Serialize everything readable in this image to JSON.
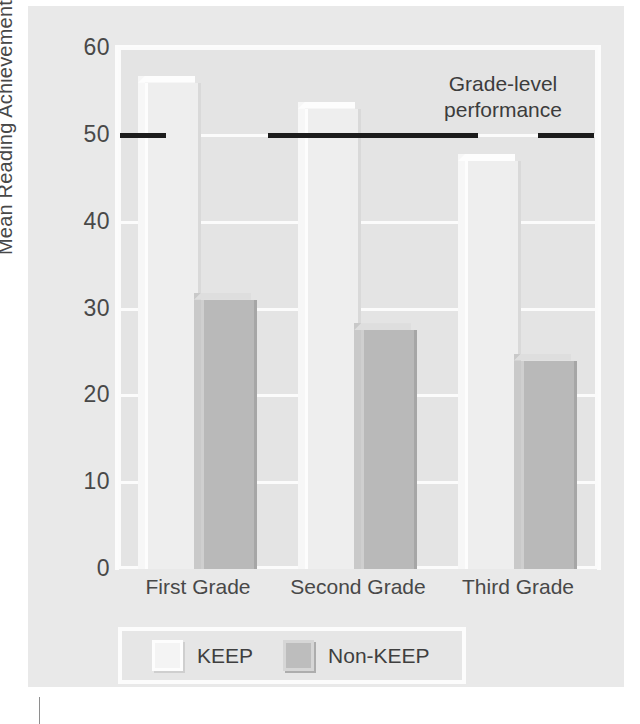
{
  "chart_data": {
    "type": "bar",
    "title": "",
    "xlabel": "",
    "ylabel": "Mean Reading Achievement",
    "ylim": [
      0,
      60
    ],
    "yticks": [
      0,
      10,
      20,
      30,
      40,
      50,
      60
    ],
    "ytick_labels": [
      "0",
      "10",
      "20",
      "30",
      "40",
      "50",
      "60"
    ],
    "grid": true,
    "legend_position": "bottom-left",
    "categories": [
      "First Grade",
      "Second Grade",
      "Third Grade"
    ],
    "series": [
      {
        "name": "KEEP",
        "values": [
          56,
          53,
          47
        ],
        "color": "#eeeeee"
      },
      {
        "name": "Non-KEEP",
        "values": [
          31,
          27.5,
          24
        ],
        "color": "#b9b9b9"
      }
    ],
    "annotations": [
      {
        "name": "grade-level-performance",
        "text": "Grade-level\nperformance",
        "type": "reference-line",
        "value": 50,
        "color": "#1c1c1c"
      }
    ]
  },
  "legend": {
    "items": [
      {
        "label": "KEEP",
        "swatch": "keep-swatch"
      },
      {
        "label": "Non-KEEP",
        "swatch": "nonkeep-swatch"
      }
    ]
  }
}
